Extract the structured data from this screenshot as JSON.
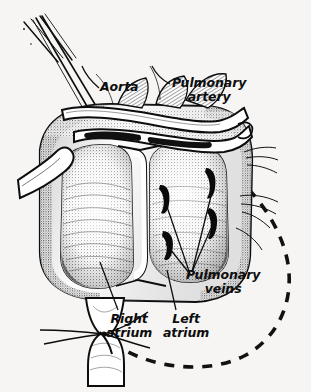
{
  "figure": {
    "kind": "anatomical-line-illustration",
    "width": 311,
    "height": 392,
    "background_color": "#f6f5f3",
    "ink_color": "#0d0d0d"
  },
  "labels": {
    "aorta": "Aorta",
    "pulmonary_artery": "Pulmonary\nartery",
    "pulmonary_veins": "Pulmonary\nveins",
    "right_atrium": "Right\natrium",
    "left_atrium": "Left\natrium"
  },
  "structures": {
    "right_atrium_chamber": "right-atrium-chamber",
    "left_atrium_chamber": "left-atrium-chamber",
    "interatrial_septum": "interatrial-septum",
    "aorta_vessel": "aorta-vessel",
    "pulmonary_artery_vessel": "pulmonary-artery-vessel",
    "superior_vena_cava": "superior-vena-cava",
    "inferior_vena_cava": "inferior-vena-cava",
    "vena_cava_ligature": "vena-cava-ligature",
    "cannula_tubes": "cannula-tubes",
    "pulmonary_vein_ostia_count": 4,
    "dashed_outline": "dashed-resection-outline"
  },
  "leaders": {
    "aorta": "leader-aorta",
    "pulmonary_artery": "leader-pulmonary-artery",
    "right_atrium": "leader-right-atrium",
    "left_atrium": "leader-left-atrium",
    "pulmonary_veins_count": 4
  }
}
